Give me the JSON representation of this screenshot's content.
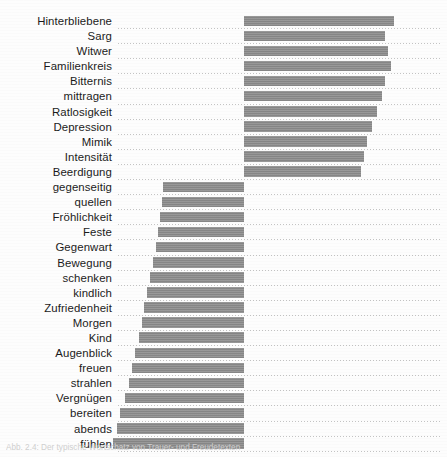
{
  "chart_data": {
    "type": "bar",
    "orientation": "horizontal",
    "title": "",
    "subtitle": "",
    "xlabel": "",
    "ylabel": "",
    "grid": true,
    "legend": null,
    "baseline_value": 0,
    "xlim": [
      -100,
      100
    ],
    "note": "Diverging horizontal bar chart; upper group of terms has positive bars extending right, lower group has negative bars extending left from a common baseline.",
    "categories": [
      "Hinterbliebene",
      "Sarg",
      "Witwer",
      "Familienkreis",
      "Bitternis",
      "mittragen",
      "Ratlosigkeit",
      "Depression",
      "Mimik",
      "Intensität",
      "Beerdigung",
      "gegenseitig",
      "quellen",
      "Fröhlichkeit",
      "Feste",
      "Gegenwart",
      "Bewegung",
      "schenken",
      "kindlich",
      "Zufriedenheit",
      "Morgen",
      "Kind",
      "Augenblick",
      "freuen",
      "strahlen",
      "Vergnügen",
      "bereiten",
      "abends",
      "fühlen"
    ],
    "values": [
      74.5,
      70.0,
      71.5,
      73.0,
      70.0,
      68.5,
      66.0,
      63.5,
      61.0,
      59.5,
      58.0,
      -40.0,
      -40.5,
      -41.5,
      -42.5,
      -43.5,
      -45.0,
      -46.5,
      -48.0,
      -49.5,
      -50.5,
      -52.0,
      -54.0,
      -55.5,
      -57.0,
      -59.0,
      -61.5,
      -63.0,
      -65.0
    ]
  },
  "caption": {
    "text": "Abb. 2.4: Der typische Wortschatz von Trauer- und Freudetexten"
  }
}
